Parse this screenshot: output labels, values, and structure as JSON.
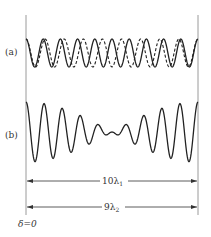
{
  "figure": {
    "panel_a_label": "(a)",
    "panel_b_label": "(b)",
    "span_1_label": "10λ",
    "span_1_sub": "1",
    "span_2_label": "9λ",
    "span_2_sub": "2",
    "origin_label": "δ=0"
  },
  "waves": {
    "a": {
      "solid_cycles": 10,
      "dashed_cycles": 9,
      "description": "Two cosine waves: solid with 10 periods, dashed with 9 periods over the same span"
    },
    "b": {
      "description": "Superposition of the two waves showing beats; amplitude minimum near center"
    }
  },
  "colors": {
    "ink": "#222222",
    "frame": "#999999"
  }
}
